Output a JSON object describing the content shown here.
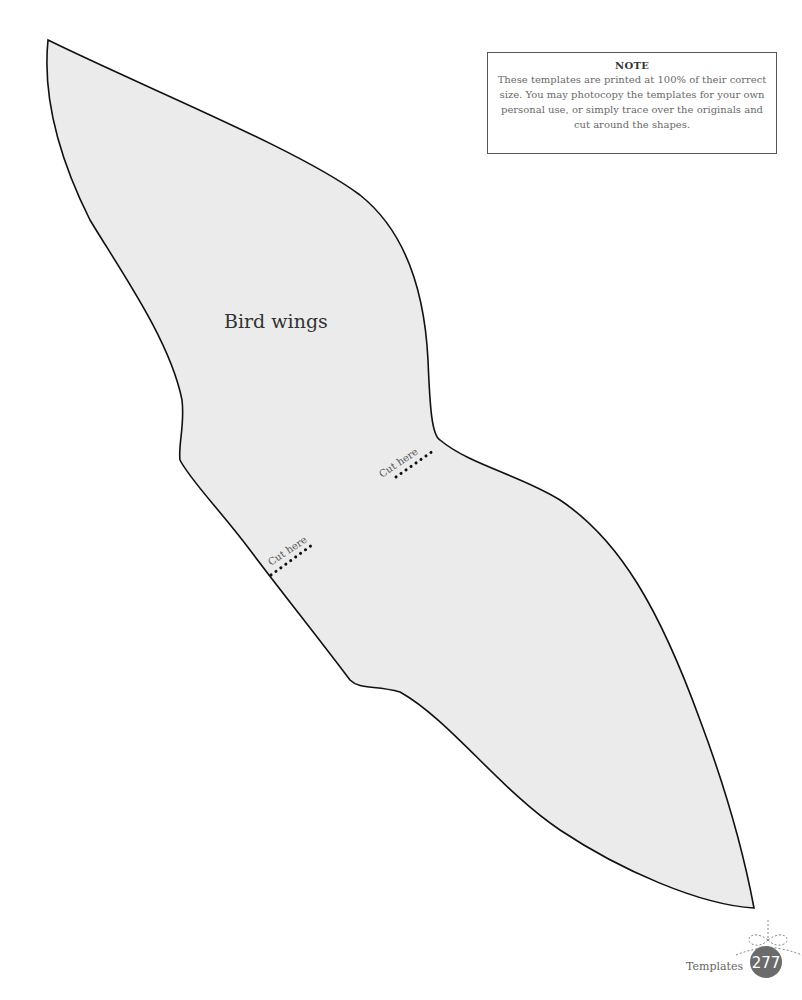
{
  "template": {
    "title": "Bird wings",
    "cut_labels": [
      "Cut here",
      "Cut here"
    ],
    "fill_color": "#ebebeb",
    "outline_color": "#111111"
  },
  "note": {
    "title": "NOTE",
    "body": "These templates are printed at 100% of their correct size. You may photocopy the templates for your own personal use, or simply trace over the originals and cut around the shapes."
  },
  "footer": {
    "section": "Templates",
    "page_number": "277",
    "badge_color": "#6b6b6b"
  }
}
